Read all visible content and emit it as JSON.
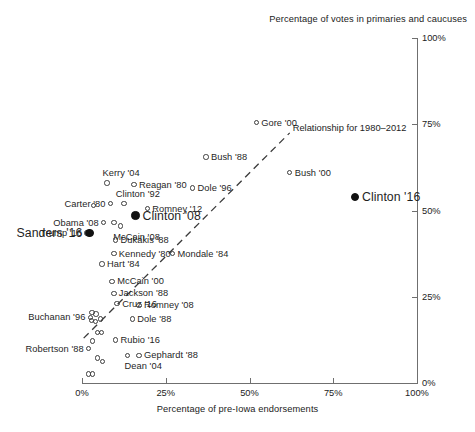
{
  "chart_data": {
    "type": "scatter",
    "title": "",
    "xlabel": "Percentage of pre-Iowa endorsements",
    "ylabel": "Percentage of votes in primaries and caucuses",
    "xlim": [
      0,
      100
    ],
    "ylim": [
      0,
      100
    ],
    "xticks": [
      "0%",
      "25%",
      "50%",
      "75%",
      "100%"
    ],
    "yticks": [
      "0%",
      "25%",
      "50%",
      "75%",
      "100%"
    ],
    "grid": false,
    "legend": null,
    "annotations": [
      {
        "name": "trend-annotation",
        "text": "Relationship for 1980–2012"
      }
    ],
    "series": [
      {
        "name": "Candidates 1980-2012 (open markers)",
        "marker": "open-circle",
        "points": [
          {
            "label": "Gore '00",
            "x": 52.0,
            "y": 75.5,
            "side": "right"
          },
          {
            "label": "Bush '88",
            "x": 37.0,
            "y": 65.5,
            "side": "right"
          },
          {
            "label": "Bush '00",
            "x": 62.0,
            "y": 61.0,
            "side": "right"
          },
          {
            "label": "Dole '96",
            "x": 33.0,
            "y": 56.5,
            "side": "right"
          },
          {
            "label": "Kerry '04",
            "x": 7.5,
            "y": 58.0,
            "side": "above"
          },
          {
            "label": "Reagan '80",
            "x": 15.5,
            "y": 57.5,
            "side": "right"
          },
          {
            "label": "Clinton '92",
            "x": 12.5,
            "y": 52.0,
            "side": "above"
          },
          {
            "label": "Carter '80",
            "x": 8.5,
            "y": 52.0,
            "side": "left"
          },
          {
            "label": "Romney '12",
            "x": 19.5,
            "y": 50.5,
            "side": "right"
          },
          {
            "label": "Obama '08",
            "x": 6.5,
            "y": 46.5,
            "side": "left"
          },
          {
            "label": "Trump '16",
            "x": 1.5,
            "y": 43.5,
            "side": "left"
          },
          {
            "label": "McCain '08",
            "x": 11.5,
            "y": 45.5,
            "side": "below"
          },
          {
            "label": "Dukakis '88",
            "x": 10.0,
            "y": 41.5,
            "side": "right"
          },
          {
            "label": "Kennedy '80",
            "x": 9.5,
            "y": 37.5,
            "side": "right"
          },
          {
            "label": "Mondale '84",
            "x": 27.0,
            "y": 37.5,
            "side": "right"
          },
          {
            "label": "Hart '84",
            "x": 6.0,
            "y": 34.5,
            "side": "right"
          },
          {
            "label": "McCain '00",
            "x": 9.0,
            "y": 29.5,
            "side": "right"
          },
          {
            "label": "Jackson '88",
            "x": 9.5,
            "y": 26.0,
            "side": "right"
          },
          {
            "label": "Cruz '16",
            "x": 10.5,
            "y": 23.0,
            "side": "right"
          },
          {
            "label": "Romney '08",
            "x": 17.0,
            "y": 22.5,
            "side": "right"
          },
          {
            "label": "Buchanan '96",
            "x": 2.5,
            "y": 19.0,
            "side": "left"
          },
          {
            "label": "Dole '88",
            "x": 15.0,
            "y": 18.5,
            "side": "right"
          },
          {
            "label": "Rubio '16",
            "x": 10.0,
            "y": 12.5,
            "side": "right"
          },
          {
            "label": "Robertson '88",
            "x": 2.0,
            "y": 10.0,
            "side": "left"
          },
          {
            "label": "Gephardt '88",
            "x": 17.0,
            "y": 8.0,
            "side": "right"
          },
          {
            "label": "Dean '04",
            "x": 13.5,
            "y": 8.0,
            "side": "below"
          }
        ]
      },
      {
        "name": "2016 front-runners (filled markers)",
        "marker": "filled-circle",
        "points": [
          {
            "label": "Clinton '16",
            "x": 81.5,
            "y": 54.0,
            "side": "right"
          },
          {
            "label": "Clinton '08",
            "x": 16.0,
            "y": 48.5,
            "side": "right"
          },
          {
            "label": "Sanders '16",
            "x": 2.2,
            "y": 43.5,
            "side": "left"
          }
        ]
      },
      {
        "name": "Unlabeled candidates",
        "marker": "open-circle",
        "points": [
          {
            "label": "",
            "x": 3.5,
            "y": 51.5
          },
          {
            "label": "",
            "x": 9.5,
            "y": 46.5
          },
          {
            "label": "",
            "x": 3.0,
            "y": 20.5
          },
          {
            "label": "",
            "x": 4.2,
            "y": 20.0
          },
          {
            "label": "",
            "x": 2.8,
            "y": 18.2
          },
          {
            "label": "",
            "x": 4.0,
            "y": 17.8
          },
          {
            "label": "",
            "x": 5.5,
            "y": 18.6
          },
          {
            "label": "",
            "x": 4.6,
            "y": 14.6
          },
          {
            "label": "",
            "x": 5.8,
            "y": 14.6
          },
          {
            "label": "",
            "x": 3.2,
            "y": 12.2
          },
          {
            "label": "",
            "x": 4.6,
            "y": 7.2
          },
          {
            "label": "",
            "x": 6.2,
            "y": 6.2
          },
          {
            "label": "",
            "x": 2.0,
            "y": 2.6
          },
          {
            "label": "",
            "x": 3.2,
            "y": 2.6
          }
        ]
      }
    ],
    "trend": {
      "name": "Relationship for 1980-2012",
      "style": "dashed",
      "x0": 0.5,
      "y0": 13.0,
      "x1": 62.0,
      "y1": 72.5
    }
  }
}
